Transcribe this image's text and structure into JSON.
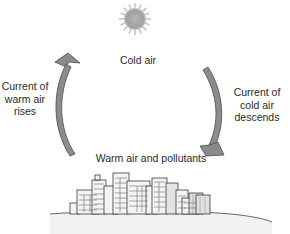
{
  "diagram": {
    "type": "air-circulation-cycle",
    "sun": {
      "icon": "sun-icon",
      "color": "#a8a8a8"
    },
    "labels": {
      "top": "Cold air",
      "left": [
        "Current of",
        "warm air",
        "rises"
      ],
      "right": [
        "Current of",
        "cold air",
        "descends"
      ],
      "bottom": "Warm air and pollutants"
    },
    "arrows": [
      {
        "name": "warm-air-rising-arrow",
        "direction": "up",
        "side": "left"
      },
      {
        "name": "cold-air-descending-arrow",
        "direction": "down",
        "side": "right"
      }
    ],
    "colors": {
      "arrow_fill": "#8c8c8c",
      "arrow_stroke": "#4a4a4a",
      "text": "#2a2a2a",
      "ground": "#d8d8d8"
    }
  }
}
